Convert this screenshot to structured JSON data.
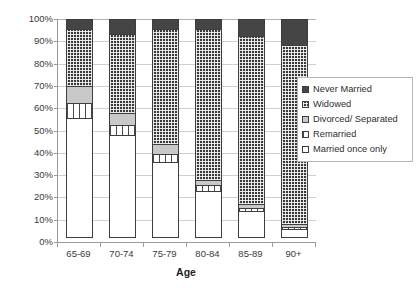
{
  "chart_data": {
    "type": "bar",
    "subtype": "stacked-100-percent",
    "title": "",
    "xlabel": "Age",
    "ylabel": "",
    "ylim": [
      0,
      100
    ],
    "yticks": [
      "0%",
      "10%",
      "20%",
      "30%",
      "40%",
      "50%",
      "60%",
      "70%",
      "80%",
      "90%",
      "100%"
    ],
    "grid": true,
    "legend_position": "right",
    "categories": [
      "65-69",
      "70-74",
      "75-79",
      "80-84",
      "85-89",
      "90+"
    ],
    "series": [
      {
        "name": "Married once only",
        "swatch": "white-solid",
        "color": "#ffffff",
        "values": [
          54,
          46,
          34,
          21,
          12,
          4
        ]
      },
      {
        "name": "Remarried",
        "swatch": "white-vertical-stripes",
        "color": "#ffffff",
        "values": [
          7,
          5,
          4,
          3,
          2,
          1.5
        ]
      },
      {
        "name": "Divorced/ Separated",
        "swatch": "light-gray-solid",
        "color": "#c9c9c9",
        "values": [
          8,
          6,
          5,
          3,
          2,
          1.5
        ]
      },
      {
        "name": "Widowed",
        "swatch": "dark-gray-grid-dots",
        "color": "#3a3a3a",
        "values": [
          26,
          36,
          52,
          68,
          76,
          81
        ]
      },
      {
        "name": "Never Married",
        "swatch": "dark-solid",
        "color": "#454545",
        "values": [
          5,
          7,
          5,
          5,
          8,
          12
        ]
      }
    ]
  },
  "legend": {
    "items": [
      {
        "label": "Never Married"
      },
      {
        "label": "Widowed"
      },
      {
        "label": "Divorced/ Separated"
      },
      {
        "label": "Remarried"
      },
      {
        "label": "Married once only"
      }
    ]
  }
}
